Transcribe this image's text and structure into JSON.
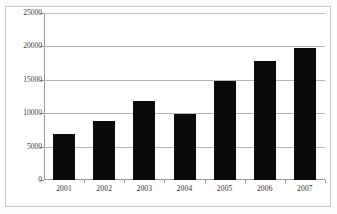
{
  "chart_data": {
    "type": "bar",
    "title": "",
    "xlabel": "",
    "ylabel": "",
    "categories": [
      "2001",
      "2002",
      "2003",
      "2004",
      "2005",
      "2006",
      "2007"
    ],
    "values": [
      6900,
      8900,
      11900,
      9900,
      14800,
      17800,
      19800
    ],
    "series": [
      {
        "name": "",
        "values": [
          6900,
          8900,
          11900,
          9900,
          14800,
          17800,
          19800
        ]
      }
    ],
    "ylim": [
      0,
      25000
    ],
    "yticks": [
      0,
      5000,
      10000,
      15000,
      20000,
      25000
    ],
    "ytick_labels": [
      "0",
      "5000",
      "10000",
      "15000",
      "20000",
      "25000"
    ],
    "grid": true,
    "grid_axis": "y",
    "legend": false,
    "legend_position": "none",
    "bar_color": "#0a0a0a",
    "plot_background": "#ffffff",
    "axis_color": "#9b9b9b",
    "grid_color": "#b4b4b4",
    "text_color": "#2f2f2f"
  },
  "figure": {
    "frame_border_color": "#c9c9c9",
    "background": "#fefefe",
    "cropped_title_remnant": ""
  }
}
